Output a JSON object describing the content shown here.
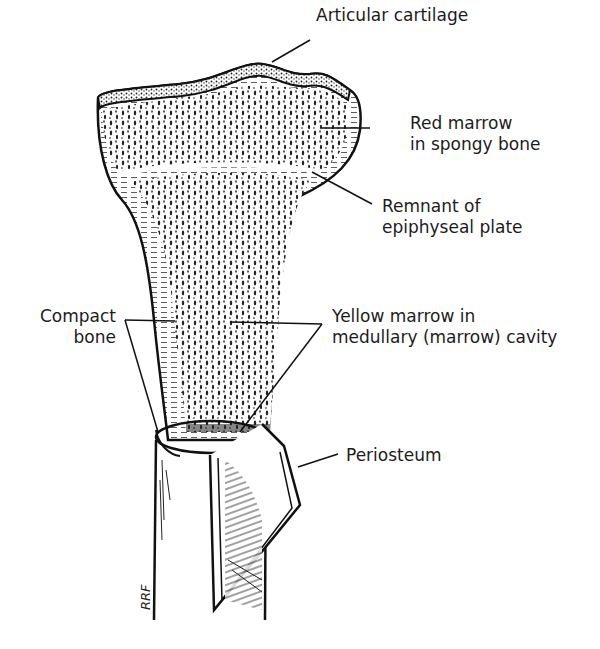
{
  "figure": {
    "labels": {
      "articular_cartilage": "Articular cartilage",
      "red_marrow_line1": "Red marrow",
      "red_marrow_line2": "in spongy bone",
      "epiphyseal_line1": "Remnant of",
      "epiphyseal_line2": "epiphyseal plate",
      "compact_line1": "Compact",
      "compact_line2": "bone",
      "yellow_line1": "Yellow marrow in",
      "yellow_line2": "medullary (marrow) cavity",
      "periosteum": "Periosteum"
    },
    "signature": "RRF",
    "colors": {
      "ink": "#1a1a1a",
      "background": "#ffffff"
    }
  }
}
